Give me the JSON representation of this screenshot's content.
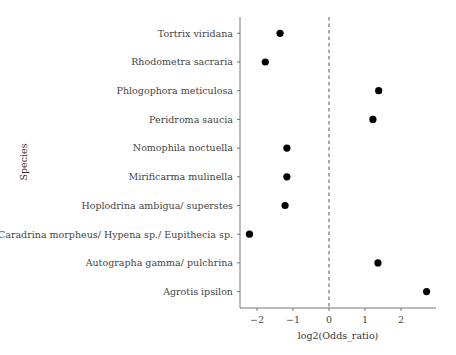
{
  "chart_data": {
    "type": "scatter",
    "title": "",
    "xlabel": "log2(Odds_ratio)",
    "ylabel": "Species",
    "xlim": [
      -2.45,
      2.95
    ],
    "x_ticks": [
      -2,
      -1,
      0,
      1,
      2
    ],
    "x_tick_labels": [
      "−2",
      "−1",
      "0",
      "1",
      "2"
    ],
    "reference_line": {
      "x": 0,
      "style": "dashed"
    },
    "grid": false,
    "legend": null,
    "categories": [
      "Tortrix viridana",
      "Rhodometra sacraria",
      "Phlogophora meticulosa",
      "Peridroma saucia",
      "Nomophila noctuella",
      "Mirificarma mulinella",
      "Hoplodrina ambigua/ superstes",
      "Caradrina morpheus/ Hypena sp./ Eupithecia sp.",
      "Autographa gamma/ pulchrina",
      "Agrotis ipsilon"
    ],
    "values": [
      -1.36,
      -1.77,
      1.38,
      1.22,
      -1.17,
      -1.17,
      -1.22,
      -2.21,
      1.36,
      2.71
    ],
    "point_color": "#000000"
  }
}
